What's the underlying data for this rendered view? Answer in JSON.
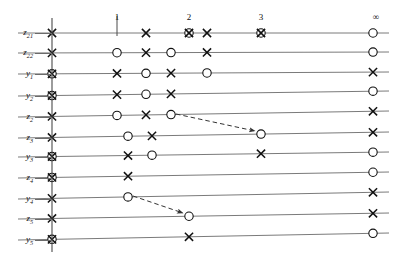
{
  "figure": {
    "type": "event-timeline-lattice",
    "background": "#ffffff",
    "line_color": "#6b6b6b",
    "marker_color": "#111111",
    "dash_color": "#333333",
    "width": 399,
    "height": 261,
    "axis": {
      "name": "vertical-axis",
      "x": 52,
      "y_top": 18,
      "y_bottom": 252
    },
    "column_labels": [
      {
        "text": "1",
        "x": 117,
        "y": 12
      },
      {
        "text": "2",
        "x": 189,
        "y": 12
      },
      {
        "text": "3",
        "x": 261,
        "y": 12
      },
      {
        "text": "∞",
        "x": 376,
        "y": 12
      }
    ],
    "column_tick": {
      "name": "column-1-tick",
      "x": 117,
      "y_top": 16,
      "y_bottom": 36
    },
    "rows": [
      {
        "label": "z",
        "sub": "21",
        "label_x": 33,
        "y_left": 33,
        "y_right": 33,
        "markers": [
          {
            "type": "x",
            "x": 52
          },
          {
            "type": "x",
            "x": 146
          },
          {
            "type": "circle-x",
            "x": 189
          },
          {
            "type": "x",
            "x": 207
          },
          {
            "type": "circle-x",
            "x": 261
          },
          {
            "type": "circle",
            "x": 373
          }
        ]
      },
      {
        "label": "z",
        "sub": "22",
        "label_x": 33,
        "y_left": 53,
        "y_right": 52,
        "markers": [
          {
            "type": "x",
            "x": 52
          },
          {
            "type": "circle",
            "x": 117
          },
          {
            "type": "x",
            "x": 146
          },
          {
            "type": "circle",
            "x": 171
          },
          {
            "type": "x",
            "x": 207
          },
          {
            "type": "circle",
            "x": 373
          }
        ]
      },
      {
        "label": "y",
        "sub": "1",
        "label_x": 33,
        "y_left": 74,
        "y_right": 72,
        "markers": [
          {
            "type": "circle-x",
            "x": 52
          },
          {
            "type": "x",
            "x": 117
          },
          {
            "type": "circle",
            "x": 146
          },
          {
            "type": "x",
            "x": 171
          },
          {
            "type": "circle",
            "x": 207
          },
          {
            "type": "x",
            "x": 373
          }
        ]
      },
      {
        "label": "y",
        "sub": "2",
        "label_x": 33,
        "y_left": 96,
        "y_right": 91,
        "markers": [
          {
            "type": "circle-x",
            "x": 52
          },
          {
            "type": "x",
            "x": 117
          },
          {
            "type": "circle",
            "x": 146
          },
          {
            "type": "x",
            "x": 171
          },
          {
            "type": "circle",
            "x": 373
          }
        ]
      },
      {
        "label": "z",
        "sub": "2",
        "label_x": 33,
        "y_left": 117,
        "y_right": 111,
        "markers": [
          {
            "type": "x",
            "x": 52
          },
          {
            "type": "circle",
            "x": 117
          },
          {
            "type": "x",
            "x": 146
          },
          {
            "type": "circle",
            "x": 171
          },
          {
            "type": "x",
            "x": 373
          }
        ]
      },
      {
        "label": "z",
        "sub": "3",
        "label_x": 33,
        "y_left": 138,
        "y_right": 132,
        "markers": [
          {
            "type": "x",
            "x": 52
          },
          {
            "type": "circle",
            "x": 128
          },
          {
            "type": "x",
            "x": 152
          },
          {
            "type": "circle",
            "x": 261
          },
          {
            "type": "x",
            "x": 373
          }
        ]
      },
      {
        "label": "y",
        "sub": "3",
        "label_x": 33,
        "y_left": 157,
        "y_right": 152,
        "markers": [
          {
            "type": "circle-x",
            "x": 52
          },
          {
            "type": "x",
            "x": 128
          },
          {
            "type": "circle",
            "x": 152
          },
          {
            "type": "x",
            "x": 261
          },
          {
            "type": "circle",
            "x": 373
          }
        ]
      },
      {
        "label": "z",
        "sub": "4",
        "label_x": 33,
        "y_left": 178,
        "y_right": 172,
        "markers": [
          {
            "type": "circle-x",
            "x": 52
          },
          {
            "type": "x",
            "x": 128
          },
          {
            "type": "circle",
            "x": 373
          }
        ]
      },
      {
        "label": "y",
        "sub": "4",
        "label_x": 33,
        "y_left": 199,
        "y_right": 192,
        "markers": [
          {
            "type": "x",
            "x": 52
          },
          {
            "type": "circle",
            "x": 128
          },
          {
            "type": "x",
            "x": 373
          }
        ]
      },
      {
        "label": "z",
        "sub": "5",
        "label_x": 33,
        "y_left": 219,
        "y_right": 213,
        "markers": [
          {
            "type": "x",
            "x": 52
          },
          {
            "type": "circle",
            "x": 189
          },
          {
            "type": "x",
            "x": 373
          }
        ]
      },
      {
        "label": "y",
        "sub": "5",
        "label_x": 33,
        "y_left": 240,
        "y_right": 233,
        "markers": [
          {
            "type": "circle-x",
            "x": 52
          },
          {
            "type": "x",
            "x": 189
          },
          {
            "type": "circle",
            "x": 373
          }
        ]
      }
    ],
    "arrows": [
      {
        "name": "arrow-z2-to-z3",
        "x1": 176,
        "y1": 114,
        "x2": 255,
        "y2": 131
      },
      {
        "name": "arrow-y4-to-z5",
        "x1": 133,
        "y1": 196,
        "x2": 183,
        "y2": 213
      }
    ]
  }
}
